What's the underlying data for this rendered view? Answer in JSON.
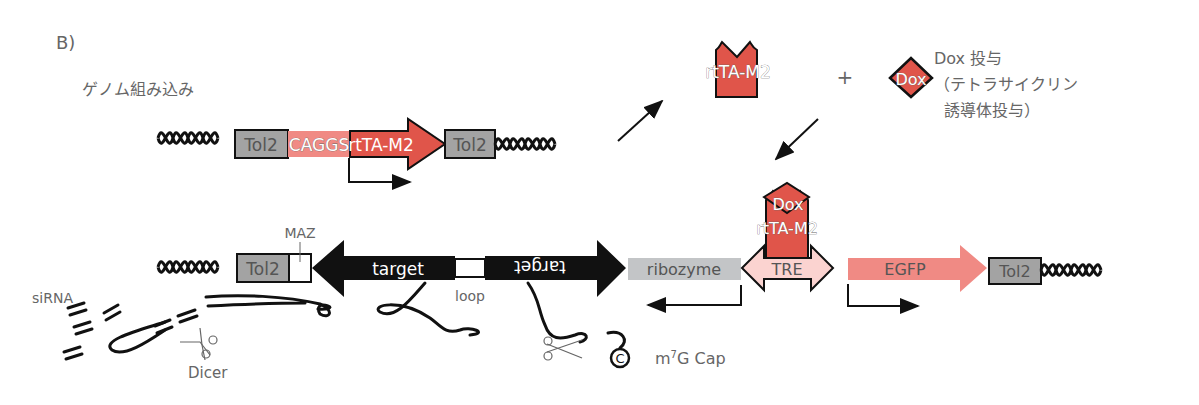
{
  "panel_label": "B)",
  "title": "ゲノム組み込み",
  "colors": {
    "red": "#e0554a",
    "light_red": "#f08a84",
    "pink": "#fbd3d0",
    "tol2_gray": "#a3a3a3",
    "ribozyme_gray": "#c3c5c7",
    "black": "#111111",
    "text_gray": "#666666"
  },
  "construct1": {
    "tol2_left": "Tol2",
    "promoter": "CAGGS",
    "gene": "rtTA-M2",
    "tol2_right": "Tol2"
  },
  "activation": {
    "protein": "rtTA-M2",
    "plus": "+",
    "drug": "Dox",
    "drug_label_line1": "Dox 投与",
    "drug_label_line2": "（テトラサイクリン",
    "drug_label_line3": "誘導体投与）"
  },
  "construct2": {
    "tol2_left": "Tol2",
    "maz_label": "MAZ",
    "target_left": "target",
    "loop_label": "loop",
    "target_right": "target",
    "ribozyme": "ribozyme",
    "tre": "TRE",
    "bound_drug": "Dox",
    "bound_protein": "rtTA-M2",
    "reporter": "EGFP",
    "tol2_right": "Tol2"
  },
  "processing": {
    "sirna_label": "siRNA",
    "dicer_label": "Dicer",
    "cap_symbol": "C",
    "cap_label_m": "m",
    "cap_label_sup": "7",
    "cap_label_rest": "G Cap"
  }
}
